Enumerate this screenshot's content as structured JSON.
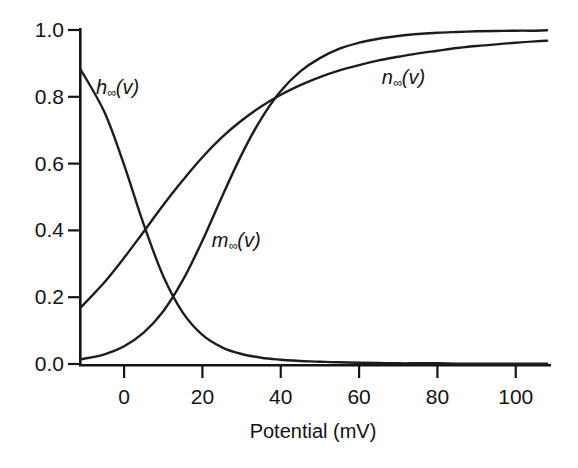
{
  "figure": {
    "background": "#ffffff",
    "curve_color": "#1d1d1d",
    "axis_color": "#151515",
    "text_color": "#131313"
  },
  "chart_data": {
    "type": "line",
    "title": "",
    "xlabel": "Potential (mV)",
    "ylabel": "",
    "xlim": [
      -11,
      109
    ],
    "ylim": [
      0,
      1.0
    ],
    "grid": false,
    "legend": "inline-annotations",
    "x_ticks": [
      0,
      20,
      40,
      60,
      80,
      100
    ],
    "x_tick_labels": [
      "0",
      "20",
      "40",
      "60",
      "80",
      "100"
    ],
    "y_ticks": [
      0.0,
      0.2,
      0.4,
      0.6,
      0.8,
      1.0
    ],
    "y_tick_labels": [
      "0.0",
      "0.2",
      "0.4",
      "0.6",
      "0.8",
      "1.0"
    ],
    "x": [
      -11,
      -5,
      0,
      5,
      10,
      15,
      20,
      25,
      30,
      35,
      40,
      45,
      50,
      55,
      60,
      65,
      70,
      75,
      80,
      85,
      90,
      95,
      100,
      105,
      108
    ],
    "series": [
      {
        "name": "h-infinity",
        "label": "h∞(v)",
        "label_var": "h",
        "label_sub": "∞",
        "label_arg": "(v)",
        "label_anchor": {
          "v": -7.2,
          "value": 0.83
        },
        "values": [
          0.88,
          0.754,
          0.596,
          0.418,
          0.263,
          0.154,
          0.087,
          0.05,
          0.03,
          0.019,
          0.013,
          0.009,
          0.007,
          0.005,
          0.004,
          0.003,
          0.002,
          0.002,
          0.002,
          0.001,
          0.001,
          0.001,
          0.001,
          0.001,
          0.001
        ]
      },
      {
        "name": "m-infinity",
        "label": "m∞(v)",
        "label_var": "m",
        "label_sub": "∞",
        "label_arg": "(v)",
        "label_anchor": {
          "v": 22.4,
          "value": 0.37
        },
        "values": [
          0.014,
          0.029,
          0.053,
          0.094,
          0.158,
          0.251,
          0.369,
          0.501,
          0.627,
          0.734,
          0.817,
          0.876,
          0.916,
          0.944,
          0.962,
          0.974,
          0.982,
          0.988,
          0.992,
          0.994,
          0.996,
          0.997,
          0.998,
          0.998,
          0.999
        ]
      },
      {
        "name": "n-infinity",
        "label": "n∞(v)",
        "label_var": "n",
        "label_sub": "∞",
        "label_arg": "(v)",
        "label_anchor": {
          "v": 65.8,
          "value": 0.86
        },
        "values": [
          0.17,
          0.245,
          0.318,
          0.396,
          0.476,
          0.55,
          0.619,
          0.679,
          0.729,
          0.771,
          0.806,
          0.835,
          0.859,
          0.879,
          0.895,
          0.909,
          0.92,
          0.93,
          0.938,
          0.946,
          0.952,
          0.957,
          0.962,
          0.966,
          0.968
        ]
      }
    ]
  }
}
